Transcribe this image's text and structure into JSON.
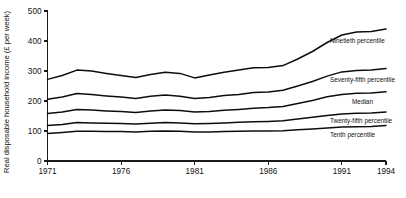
{
  "chart_data": {
    "type": "line",
    "title": "",
    "xlabel": "",
    "ylabel": "Real disposable household income (£ per week)",
    "ylim": [
      0,
      500
    ],
    "yticks": [
      0,
      100,
      200,
      300,
      400,
      500
    ],
    "xlim": [
      1971,
      1994
    ],
    "xticks": [
      1971,
      1976,
      1981,
      1986,
      1991,
      1994
    ],
    "xtick_labels": [
      "1971",
      "1976",
      "1981",
      "1986",
      "1991",
      "1994"
    ],
    "ytick_labels": [
      "0",
      "100",
      "200",
      "300",
      "400",
      "500"
    ],
    "grid": false,
    "legend": "inline-right-labels",
    "x": [
      1971,
      1972,
      1973,
      1974,
      1975,
      1976,
      1977,
      1978,
      1979,
      1980,
      1981,
      1982,
      1983,
      1984,
      1985,
      1986,
      1987,
      1988,
      1989,
      1990,
      1991,
      1992,
      1993,
      1994
    ],
    "series": [
      {
        "name": "Ninetieth percentile",
        "label": "Ninetieth percentile",
        "values": [
          272,
          285,
          303,
          300,
          292,
          285,
          278,
          288,
          296,
          292,
          277,
          287,
          296,
          303,
          311,
          312,
          318,
          340,
          365,
          395,
          420,
          430,
          432,
          440
        ]
      },
      {
        "name": "Seventy-fifth percentile",
        "label": "Seventy-fifth percentile",
        "values": [
          206,
          213,
          225,
          222,
          217,
          213,
          208,
          216,
          220,
          216,
          208,
          212,
          218,
          222,
          228,
          230,
          236,
          250,
          265,
          283,
          297,
          302,
          303,
          308
        ]
      },
      {
        "name": "Median",
        "label": "Median",
        "values": [
          158,
          163,
          172,
          170,
          167,
          165,
          162,
          167,
          170,
          168,
          163,
          165,
          169,
          172,
          176,
          178,
          182,
          192,
          202,
          214,
          222,
          226,
          227,
          231
        ]
      },
      {
        "name": "Twenty-fifth percentile",
        "label": "Twenty-fifth percentile",
        "values": [
          118,
          122,
          128,
          127,
          126,
          125,
          123,
          126,
          128,
          127,
          124,
          125,
          127,
          129,
          131,
          132,
          134,
          140,
          146,
          152,
          157,
          159,
          160,
          163
        ]
      },
      {
        "name": "Tenth percentile",
        "label": "Tenth percentile",
        "values": [
          92,
          95,
          99,
          99,
          98,
          98,
          97,
          99,
          100,
          99,
          97,
          97,
          98,
          99,
          100,
          100,
          101,
          104,
          107,
          110,
          113,
          114,
          115,
          118
        ]
      }
    ]
  },
  "colors": {
    "line": "#0d0d0d",
    "axis": "#1a1a1a",
    "text": "#111111",
    "background": "#ffffff"
  }
}
